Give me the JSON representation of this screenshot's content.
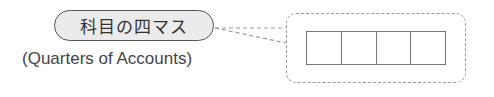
{
  "label": {
    "title": "科目の四マス",
    "subtitle": "(Quarters of Accounts)"
  },
  "diagram": {
    "grid_cells": 4,
    "connector_style": "dashed",
    "colors": {
      "pill_fill": "#ebebeb",
      "pill_border": "#555555",
      "text": "#333333",
      "dash": "#999999",
      "grid_line": "#777777"
    }
  }
}
